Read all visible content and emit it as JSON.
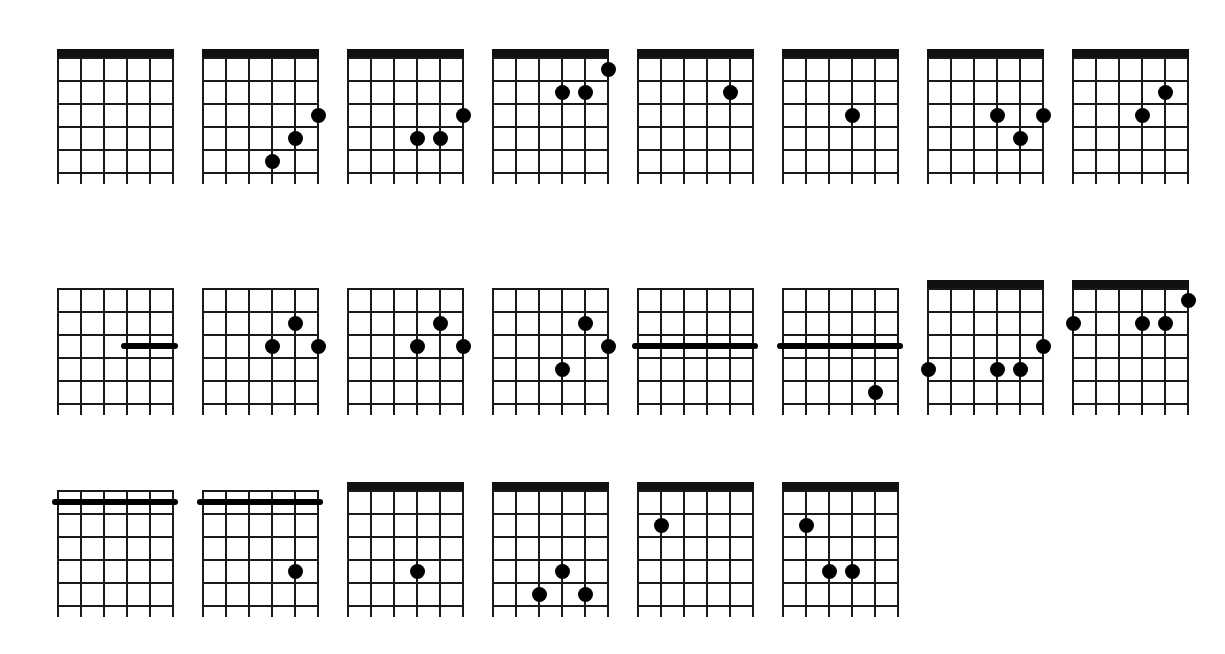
{
  "page": {
    "background_color": "#ffffff",
    "ink_color": "#000000",
    "string_count": 6,
    "fret_count": 5
  },
  "legend": {
    "x_marker": "x",
    "dot_meaning": "fretted note",
    "barre_meaning": "barre across strings",
    "roman_meaning": "fret position"
  },
  "chords": [
    {
      "id": "c-open-1",
      "name": "C",
      "row": 1,
      "col": 1,
      "x": 57,
      "y": 57,
      "has_nut": true,
      "position_label": "",
      "x_markers": [],
      "dots": [],
      "barres": []
    },
    {
      "id": "c-open-2",
      "name": "C",
      "row": 1,
      "col": 2,
      "x": 202,
      "y": 57,
      "has_nut": true,
      "position_label": "",
      "x_markers": [],
      "dots": [
        {
          "string": 6,
          "fret": 3
        },
        {
          "string": 5,
          "fret": 4
        },
        {
          "string": 4,
          "fret": 5
        }
      ],
      "barres": []
    },
    {
      "id": "cmaj7-open",
      "name": "Cmaj7",
      "row": 1,
      "col": 3,
      "x": 347,
      "y": 57,
      "has_nut": true,
      "position_label": "",
      "x_markers": [],
      "dots": [
        {
          "string": 6,
          "fret": 3
        },
        {
          "string": 5,
          "fret": 4
        },
        {
          "string": 4,
          "fret": 4
        }
      ],
      "barres": []
    },
    {
      "id": "dmc-open",
      "name": "Dm/C",
      "row": 1,
      "col": 4,
      "x": 492,
      "y": 57,
      "has_nut": true,
      "position_label": "",
      "x_markers": [
        2
      ],
      "dots": [
        {
          "string": 6,
          "fret": 1
        },
        {
          "string": 5,
          "fret": 2
        },
        {
          "string": 4,
          "fret": 2
        }
      ],
      "barres": []
    },
    {
      "id": "cadd9-open",
      "name": "Cadd9",
      "row": 1,
      "col": 5,
      "x": 637,
      "y": 57,
      "has_nut": true,
      "position_label": "",
      "x_markers": [],
      "dots": [
        {
          "string": 5,
          "fret": 2
        }
      ],
      "barres": []
    },
    {
      "id": "c7-open-1",
      "name": "C7",
      "row": 1,
      "col": 6,
      "x": 782,
      "y": 57,
      "has_nut": true,
      "position_label": "",
      "x_markers": [],
      "dots": [
        {
          "string": 4,
          "fret": 3
        }
      ],
      "barres": []
    },
    {
      "id": "c7-open-2",
      "name": "C7",
      "row": 1,
      "col": 7,
      "x": 927,
      "y": 57,
      "has_nut": true,
      "position_label": "",
      "x_markers": [],
      "dots": [
        {
          "string": 4,
          "fret": 3
        },
        {
          "string": 5,
          "fret": 4
        },
        {
          "string": 6,
          "fret": 3
        }
      ],
      "barres": []
    },
    {
      "id": "c9-open",
      "name": "C9",
      "row": 1,
      "col": 8,
      "x": 1072,
      "y": 57,
      "has_nut": true,
      "position_label": "",
      "x_markers": [],
      "dots": [
        {
          "string": 4,
          "fret": 3
        },
        {
          "string": 5,
          "fret": 2
        }
      ],
      "barres": []
    },
    {
      "id": "c-xii",
      "name": "C",
      "row": 2,
      "col": 1,
      "x": 57,
      "y": 288,
      "has_nut": false,
      "position_label": "XII",
      "x_markers": [],
      "dots": [],
      "barres": [
        {
          "fret": 3,
          "from_string": 4,
          "to_string": 6
        }
      ]
    },
    {
      "id": "cmaj7-xii",
      "name": "Cmaj7",
      "row": 2,
      "col": 2,
      "x": 202,
      "y": 288,
      "has_nut": false,
      "position_label": "XII",
      "x_markers": [],
      "dots": [
        {
          "string": 4,
          "fret": 3
        },
        {
          "string": 5,
          "fret": 2
        },
        {
          "string": 6,
          "fret": 3
        }
      ],
      "barres": []
    },
    {
      "id": "dmc-x",
      "name": "Dm/C",
      "row": 2,
      "col": 3,
      "x": 347,
      "y": 288,
      "has_nut": false,
      "position_label": "X",
      "x_markers": [
        2
      ],
      "dots": [
        {
          "string": 4,
          "fret": 3
        },
        {
          "string": 5,
          "fret": 2
        },
        {
          "string": 6,
          "fret": 3
        }
      ],
      "barres": []
    },
    {
      "id": "c-viii",
      "name": "C",
      "row": 2,
      "col": 4,
      "x": 492,
      "y": 288,
      "has_nut": false,
      "position_label": "VIII",
      "x_markers": [],
      "dots": [
        {
          "string": 4,
          "fret": 4
        },
        {
          "string": 5,
          "fret": 2
        },
        {
          "string": 6,
          "fret": 3
        }
      ],
      "barres": []
    },
    {
      "id": "f-v",
      "name": "F",
      "row": 2,
      "col": 5,
      "x": 637,
      "y": 288,
      "has_nut": false,
      "position_label": "V",
      "x_markers": [],
      "dots": [],
      "barres": [
        {
          "fret": 3,
          "from_string": 1,
          "to_string": 6
        }
      ]
    },
    {
      "id": "fadd9-v",
      "name": "Fadd9",
      "row": 2,
      "col": 6,
      "x": 782,
      "y": 288,
      "has_nut": false,
      "position_label": "V",
      "x_markers": [],
      "dots": [
        {
          "string": 5,
          "fret": 5
        }
      ],
      "barres": [
        {
          "fret": 3,
          "from_string": 1,
          "to_string": 6
        }
      ]
    },
    {
      "id": "em-open",
      "name": "Em",
      "row": 2,
      "col": 7,
      "x": 927,
      "y": 288,
      "has_nut": true,
      "position_label": "",
      "x_markers": [
        2,
        3
      ],
      "dots": [
        {
          "string": 1,
          "fret": 4
        },
        {
          "string": 4,
          "fret": 4
        },
        {
          "string": 5,
          "fret": 4
        },
        {
          "string": 6,
          "fret": 3
        }
      ],
      "barres": []
    },
    {
      "id": "dm-open",
      "name": "Dm",
      "row": 2,
      "col": 8,
      "x": 1072,
      "y": 288,
      "has_nut": true,
      "position_label": "",
      "x_markers": [
        2,
        3
      ],
      "dots": [
        {
          "string": 1,
          "fret": 2
        },
        {
          "string": 4,
          "fret": 2
        },
        {
          "string": 5,
          "fret": 2
        },
        {
          "string": 6,
          "fret": 1
        }
      ],
      "barres": []
    },
    {
      "id": "g-vii",
      "name": "G",
      "row": 3,
      "col": 1,
      "x": 57,
      "y": 490,
      "has_nut": false,
      "position_label": "VII",
      "x_markers": [],
      "dots": [],
      "barres": [
        {
          "fret": 1,
          "from_string": 1,
          "to_string": 6
        }
      ]
    },
    {
      "id": "g7-vii",
      "name": "G7",
      "row": 3,
      "col": 2,
      "x": 202,
      "y": 490,
      "has_nut": false,
      "position_label": "VII",
      "x_markers": [],
      "dots": [
        {
          "string": 5,
          "fret": 4
        }
      ],
      "barres": [
        {
          "fret": 1,
          "from_string": 1,
          "to_string": 6
        }
      ]
    },
    {
      "id": "g6add4-open",
      "name": "G6add4",
      "row": 3,
      "col": 3,
      "x": 347,
      "y": 490,
      "has_nut": true,
      "position_label": "",
      "x_markers": [
        1
      ],
      "dots": [
        {
          "string": 4,
          "fret": 4
        }
      ],
      "barres": []
    },
    {
      "id": "g7add4-open",
      "name": "G7add4",
      "row": 3,
      "col": 4,
      "x": 492,
      "y": 490,
      "has_nut": true,
      "position_label": "",
      "x_markers": [
        1
      ],
      "dots": [
        {
          "string": 4,
          "fret": 4
        },
        {
          "string": 3,
          "fret": 5
        },
        {
          "string": 5,
          "fret": 5
        }
      ],
      "barres": []
    },
    {
      "id": "am7-open",
      "name": "Am7",
      "row": 3,
      "col": 5,
      "x": 637,
      "y": 490,
      "has_nut": true,
      "position_label": "",
      "x_markers": [
        1
      ],
      "dots": [
        {
          "string": 2,
          "fret": 2
        }
      ],
      "barres": []
    },
    {
      "id": "am9-open",
      "name": "Am9",
      "row": 3,
      "col": 6,
      "x": 782,
      "y": 490,
      "has_nut": true,
      "position_label": "",
      "x_markers": [
        1
      ],
      "dots": [
        {
          "string": 2,
          "fret": 2
        },
        {
          "string": 3,
          "fret": 4
        },
        {
          "string": 4,
          "fret": 4
        }
      ],
      "barres": []
    }
  ]
}
